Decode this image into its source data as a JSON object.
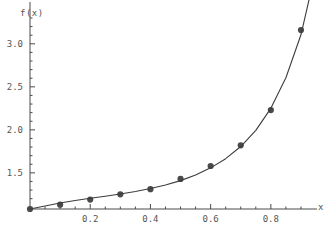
{
  "chart_data": {
    "type": "scatter",
    "title": "",
    "subtitle": "",
    "xlabel": "x",
    "ylabel": "f(x)",
    "xlim": [
      0,
      0.94
    ],
    "ylim": [
      1.08,
      3.3
    ],
    "grid": false,
    "legend": false,
    "xticks": [
      0.2,
      0.4,
      0.6,
      0.8
    ],
    "xtick_labels": [
      "0.2",
      "0.4",
      "0.6",
      "0.8"
    ],
    "yticks": [
      1.5,
      2.0,
      2.5,
      3.0
    ],
    "ytick_labels": [
      "1.5",
      "2.0",
      "2.5",
      "3.0"
    ],
    "x_minor_tick_step": 0.05,
    "y_minor_tick_step": 0.1,
    "x": [
      0.0,
      0.1,
      0.2,
      0.3,
      0.4,
      0.5,
      0.6,
      0.7,
      0.8,
      0.9
    ],
    "values": [
      1.08,
      1.13,
      1.19,
      1.25,
      1.31,
      1.43,
      1.58,
      1.82,
      2.23,
      3.16
    ],
    "series": [
      {
        "name": "data points",
        "kind": "scatter",
        "marker": "filled-circle",
        "color": "#4a4a4a",
        "x": [
          0.0,
          0.1,
          0.2,
          0.3,
          0.4,
          0.5,
          0.6,
          0.7,
          0.8,
          0.9
        ],
        "values": [
          1.08,
          1.13,
          1.19,
          1.25,
          1.31,
          1.43,
          1.58,
          1.82,
          2.23,
          3.16
        ]
      },
      {
        "name": "fitted curve",
        "kind": "line",
        "color": "#3c3c3c",
        "x": [
          0.0,
          0.05,
          0.1,
          0.15,
          0.2,
          0.25,
          0.3,
          0.35,
          0.4,
          0.45,
          0.5,
          0.55,
          0.6,
          0.65,
          0.7,
          0.75,
          0.8,
          0.85,
          0.9,
          0.93
        ],
        "values": [
          1.08,
          1.115,
          1.15,
          1.178,
          1.204,
          1.229,
          1.255,
          1.284,
          1.318,
          1.359,
          1.41,
          1.475,
          1.558,
          1.665,
          1.806,
          1.994,
          2.25,
          2.605,
          3.105,
          3.56
        ]
      }
    ],
    "axis_colors": {
      "axis": "#4a4a4a",
      "marker": "#4a4a4a",
      "curve": "#3c3c3c",
      "text": "#555555",
      "background": "#ffffff"
    }
  }
}
